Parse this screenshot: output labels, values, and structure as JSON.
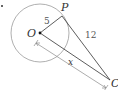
{
  "diagram": {
    "type": "geometry-tangent",
    "labels": {
      "center": "O",
      "tangent_point": "P",
      "external_point": "C",
      "radius": "5",
      "tangent_length": "12",
      "distance": "x"
    },
    "colors": {
      "circle": "#9a9a9a",
      "lines": "#333333",
      "dimension": "#8a8a8a"
    }
  }
}
